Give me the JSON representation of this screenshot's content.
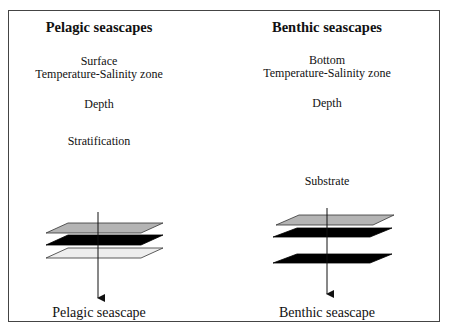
{
  "pelagic": {
    "title": "Pelagic seascapes",
    "items": [
      "Surface",
      "Temperature-Salinity zone",
      "Depth",
      "Stratification"
    ],
    "caption": "Pelagic seascape",
    "layers": [
      {
        "fill": "#b4b4b4"
      },
      {
        "fill": "#000000"
      },
      {
        "fill": "#eeeeee"
      }
    ]
  },
  "benthic": {
    "title": "Benthic seascapes",
    "items": [
      "Bottom",
      "Temperature-Salinity zone",
      "Depth",
      "Substrate"
    ],
    "caption": "Benthic seascape",
    "layers": [
      {
        "fill": "#b4b4b4"
      },
      {
        "fill": "#000000"
      },
      {
        "fill": "#000000"
      }
    ]
  }
}
